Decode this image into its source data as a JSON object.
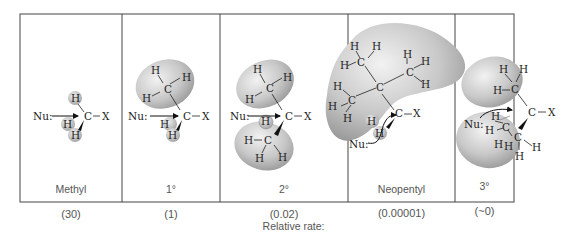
{
  "figure": {
    "caption": "Relative rate:",
    "panels": [
      {
        "id": "methyl",
        "label": "Methyl",
        "rate": "(30)"
      },
      {
        "id": "primary",
        "label": "1°",
        "rate": "(1)"
      },
      {
        "id": "secondary",
        "label": "2°",
        "rate": "(0.02)"
      },
      {
        "id": "neopentyl",
        "label": "Neopentyl",
        "rate": "(0.00001)"
      },
      {
        "id": "tertiary",
        "label": "3°",
        "rate": "(~0)"
      }
    ],
    "atoms": {
      "H": "H",
      "C": "C",
      "X": "X",
      "nucleophile": "Nu:"
    }
  }
}
